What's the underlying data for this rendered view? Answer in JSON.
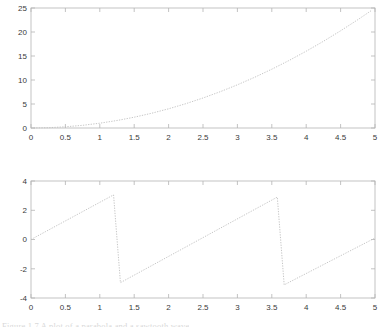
{
  "figure": {
    "background_color": "#ffffff",
    "axis_color": "#b4b4b4",
    "tick_label_color": "#3a3a3a",
    "line_color": "#c8c8c8",
    "line_style": "dotted"
  },
  "clipped_caption": "Figure 1.7  A plot of a parabola and a sawtooth wave",
  "chart_data": [
    {
      "type": "line",
      "title": "",
      "xlabel": "",
      "ylabel": "",
      "xlim": [
        0,
        5
      ],
      "ylim": [
        0,
        25
      ],
      "xticks": [
        0,
        0.5,
        1,
        1.5,
        2,
        2.5,
        3,
        3.5,
        4,
        4.5,
        5
      ],
      "xticklabels": [
        "0",
        "0.5",
        "1",
        "1.5",
        "2",
        "2.5",
        "3",
        "3.5",
        "4",
        "4.5",
        "5"
      ],
      "yticks": [
        0,
        5,
        10,
        15,
        20,
        25
      ],
      "yticklabels": [
        "0",
        "5",
        "10",
        "15",
        "20",
        "25"
      ],
      "grid": false,
      "legend": "none",
      "series": [
        {
          "name": "x squared",
          "x": [
            0,
            0.25,
            0.5,
            0.75,
            1,
            1.25,
            1.5,
            1.75,
            2,
            2.25,
            2.5,
            2.75,
            3,
            3.25,
            3.5,
            3.75,
            4,
            4.25,
            4.5,
            4.75,
            4.95
          ],
          "values": [
            0,
            0.06,
            0.25,
            0.56,
            1,
            1.56,
            2.25,
            3.06,
            4,
            5.06,
            6.25,
            7.56,
            9,
            10.56,
            12.25,
            14.06,
            16,
            18.06,
            20.25,
            22.56,
            24.5
          ]
        }
      ]
    },
    {
      "type": "line",
      "title": "",
      "xlabel": "",
      "ylabel": "",
      "xlim": [
        0,
        5
      ],
      "ylim": [
        -4,
        4
      ],
      "xticks": [
        0,
        0.5,
        1,
        1.5,
        2,
        2.5,
        3,
        3.5,
        4,
        4.5,
        5
      ],
      "xticklabels": [
        "0",
        "0.5",
        "1",
        "1.5",
        "2",
        "2.5",
        "3",
        "3.5",
        "4",
        "4.5",
        "5"
      ],
      "yticks": [
        -4,
        -2,
        0,
        2,
        4
      ],
      "yticklabels": [
        "-4",
        "-2",
        "0",
        "2",
        "4"
      ],
      "grid": false,
      "legend": "none",
      "series": [
        {
          "name": "sawtooth wave",
          "x": [
            0,
            1.2,
            1.3,
            3.58,
            3.68,
            5
          ],
          "values": [
            0,
            3.05,
            -2.95,
            2.9,
            -3.1,
            0.1
          ]
        }
      ]
    }
  ]
}
